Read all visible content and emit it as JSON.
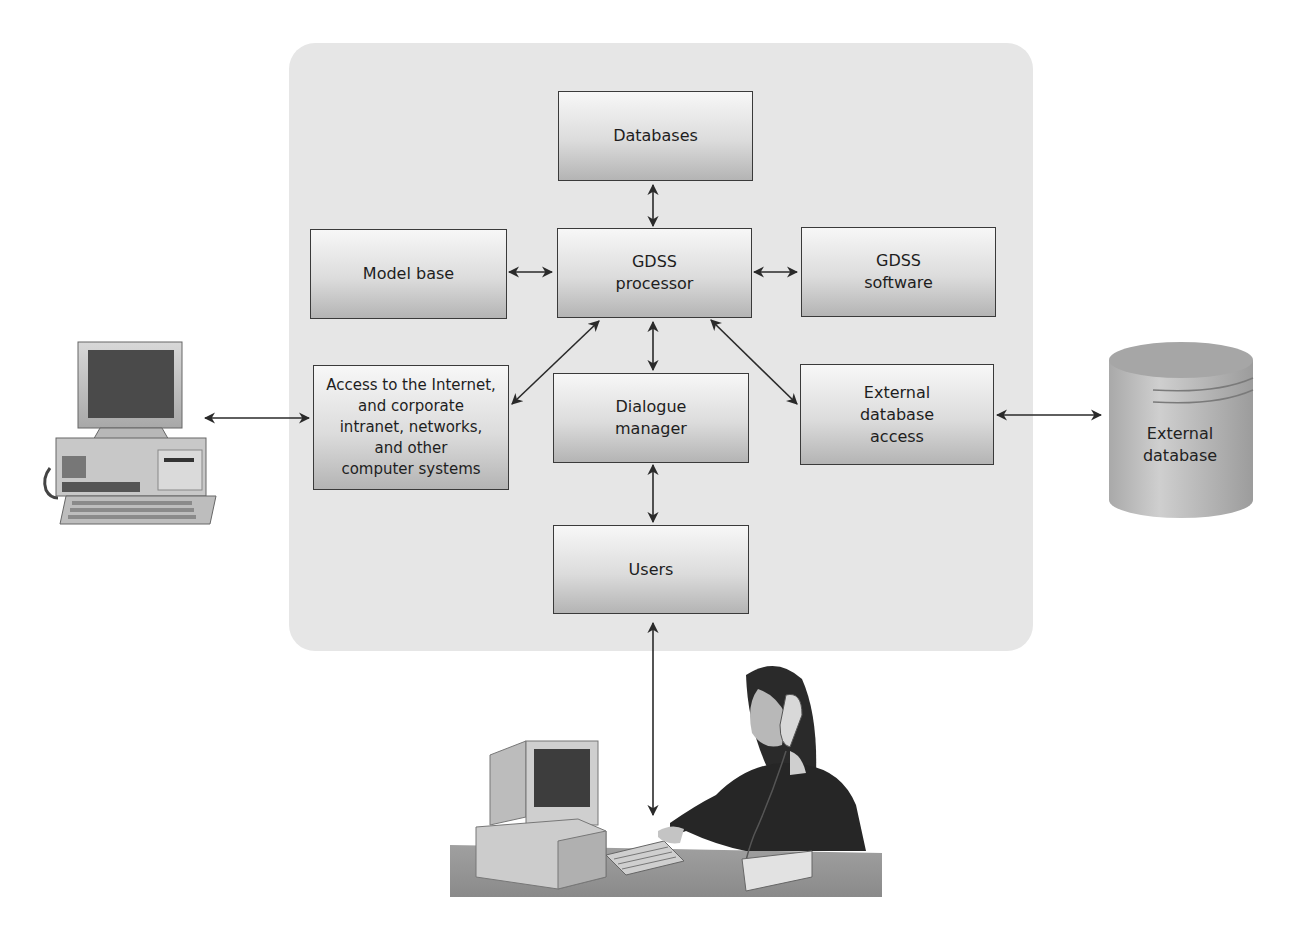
{
  "diagram": {
    "nodes": {
      "databases": "Databases",
      "model_base": "Model base",
      "gdss_processor": "GDSS\nprocessor",
      "gdss_software": "GDSS\nsoftware",
      "access_internet": "Access to the Internet,\nand corporate\nintranet, networks,\nand other\ncomputer systems",
      "dialogue_manager": "Dialogue\nmanager",
      "external_db_access": "External\ndatabase\naccess",
      "users": "Users",
      "external_database": "External\ndatabase"
    },
    "edges": [
      {
        "from": "databases",
        "to": "gdss_processor",
        "bidirectional": true
      },
      {
        "from": "model_base",
        "to": "gdss_processor",
        "bidirectional": true
      },
      {
        "from": "gdss_processor",
        "to": "gdss_software",
        "bidirectional": true
      },
      {
        "from": "gdss_processor",
        "to": "access_internet",
        "bidirectional": true
      },
      {
        "from": "gdss_processor",
        "to": "dialogue_manager",
        "bidirectional": true
      },
      {
        "from": "gdss_processor",
        "to": "external_db_access",
        "bidirectional": true
      },
      {
        "from": "dialogue_manager",
        "to": "users",
        "bidirectional": true
      },
      {
        "from": "computer_system",
        "to": "access_internet",
        "bidirectional": true
      },
      {
        "from": "external_db_access",
        "to": "external_database",
        "bidirectional": true
      },
      {
        "from": "users",
        "to": "user_person",
        "bidirectional": true
      }
    ],
    "icons": {
      "left": "desktop-computer-icon",
      "right": "database-cylinder-icon",
      "bottom": "user-at-workstation-icon"
    },
    "colors": {
      "panel": "#e6e6e6",
      "box_top": "#f7f7f7",
      "box_bottom": "#b4b4b4",
      "border": "#3a3a3a",
      "arrow": "#2a2a2a"
    }
  }
}
